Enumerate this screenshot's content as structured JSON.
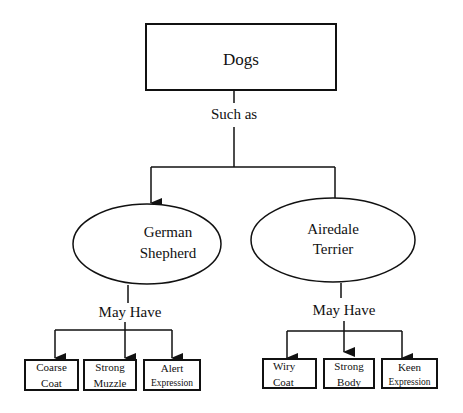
{
  "diagram": {
    "root": {
      "label": "Dogs"
    },
    "root_relation": "Such as",
    "breeds": [
      {
        "name_line1": "German",
        "name_line2": "Shepherd",
        "relation": "May Have",
        "traits": [
          {
            "line1": "Coarse",
            "line2": "Coat"
          },
          {
            "line1": "Strong",
            "line2": "Muzzle"
          },
          {
            "line1": "Alert",
            "line2": "Expression"
          }
        ]
      },
      {
        "name_line1": "Airedale",
        "name_line2": "Terrier",
        "relation": "May Have",
        "traits": [
          {
            "line1": "Wiry",
            "line2": "Coat"
          },
          {
            "line1": "Strong",
            "line2": "Body"
          },
          {
            "line1": "Keen",
            "line2": "Expression"
          }
        ]
      }
    ]
  }
}
